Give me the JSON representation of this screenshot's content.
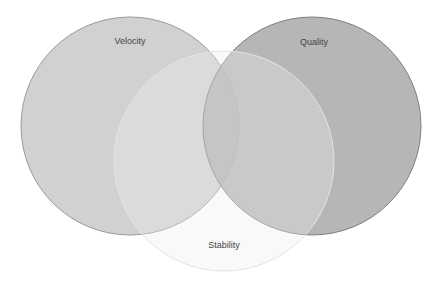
{
  "diagram": {
    "type": "venn",
    "sets": [
      {
        "id": "velocity",
        "label": "Velocity",
        "cx": 130,
        "cy": 126,
        "r": 109,
        "fill": "#c9c9c9",
        "opacity": 0.85,
        "stroke": "#9a9a9a",
        "label_x": 130,
        "label_y": 44
      },
      {
        "id": "quality",
        "label": "Quality",
        "cx": 312,
        "cy": 126,
        "r": 109,
        "fill": "#a9a9a9",
        "opacity": 0.85,
        "stroke": "#7f7f7f",
        "label_x": 314,
        "label_y": 45
      },
      {
        "id": "stability",
        "label": "Stability",
        "cx": 224,
        "cy": 161,
        "r": 110,
        "fill": "#eeeeee",
        "opacity": 0.35,
        "stroke": "#e4e4e4",
        "label_x": 224,
        "label_y": 248
      }
    ]
  }
}
